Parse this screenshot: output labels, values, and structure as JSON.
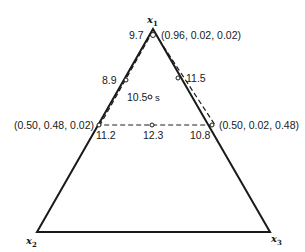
{
  "diagram": {
    "type": "simplex-lattice-triangle",
    "vertices": {
      "top": "x",
      "top_sub": "1",
      "bottom_left": "x",
      "bottom_left_sub": "2",
      "bottom_right": "x",
      "bottom_right_sub": "3"
    },
    "point_labels": {
      "top_value": "9.7",
      "top_coord": "(0.96, 0.02, 0.02)",
      "left_upper_value": "8.9",
      "right_upper_value": "11.5",
      "center_value": "10.5",
      "center_marker": "s",
      "left_mid_coord": "(0.50, 0.48, 0.02)",
      "left_mid_value": "11.2",
      "center_mid_value": "12.3",
      "right_mid_value": "10.8",
      "right_mid_coord": "(0.50, 0.02, 0.48)"
    },
    "colors": {
      "line": "#1a1a1a",
      "background": "#ffffff"
    }
  }
}
